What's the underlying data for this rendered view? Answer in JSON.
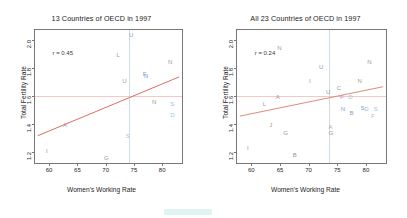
{
  "chart_data": [
    {
      "type": "scatter",
      "panel": "left",
      "title": "13 Countries of OECD in 1997",
      "xlabel": "Women's Working Rate",
      "ylabel": "Total Fertility Rate",
      "xlim": [
        57.5,
        83.5
      ],
      "ylim": [
        1.12,
        2.07
      ],
      "xticks": [
        60,
        65,
        70,
        75,
        80
      ],
      "yticks": [
        1.2,
        1.4,
        1.6,
        1.8,
        2.0
      ],
      "annotation": "r = 0.45",
      "grid": false,
      "reference_lines": {
        "horizontal_y": 1.6,
        "vertical_x": 74.2
      },
      "regression": {
        "x1": 58.0,
        "y1": 1.315,
        "x2": 83.0,
        "y2": 1.735,
        "color": "#e06c62"
      },
      "points": [
        {
          "label": "I",
          "x": 59.6,
          "y": 1.205,
          "color": "#9a9a9a"
        },
        {
          "label": "A",
          "x": 62.8,
          "y": 1.395,
          "color": "#9a9a9a"
        },
        {
          "label": "G",
          "x": 70.1,
          "y": 1.155,
          "color": "#9a9a9a"
        },
        {
          "label": "L",
          "x": 72.2,
          "y": 1.895,
          "color": "#9a9a9a"
        },
        {
          "label": "U",
          "x": 73.3,
          "y": 1.705,
          "color": "#9a9a9a"
        },
        {
          "label": "S",
          "x": 73.9,
          "y": 1.315,
          "color": "#9fc3dd"
        },
        {
          "label": "U",
          "x": 74.5,
          "y": 2.035,
          "color": "#9a9a9a"
        },
        {
          "label": "F",
          "x": 76.9,
          "y": 1.755,
          "color": "#6f9fd8"
        },
        {
          "label": "N",
          "x": 77.1,
          "y": 1.745,
          "color": "#6f9fd8"
        },
        {
          "label": "N",
          "x": 78.6,
          "y": 1.555,
          "color": "#9a9a9a"
        },
        {
          "label": "N",
          "x": 81.4,
          "y": 1.845,
          "color": "#9a9a9a"
        },
        {
          "label": "S",
          "x": 81.8,
          "y": 1.545,
          "color": "#9fc3dd"
        },
        {
          "label": "D",
          "x": 81.8,
          "y": 1.465,
          "color": "#9fc3dd"
        }
      ]
    },
    {
      "type": "scatter",
      "panel": "right",
      "title": "All 23 Countries of OECD in 1997",
      "xlabel": "Women's Working Rate",
      "ylabel": "Total Fertility Rate",
      "xlim": [
        57.5,
        83.5
      ],
      "ylim": [
        1.12,
        2.07
      ],
      "xticks": [
        60,
        65,
        70,
        75,
        80
      ],
      "yticks": [
        1.2,
        1.4,
        1.6,
        1.8,
        2.0
      ],
      "annotation": "r = 0.24",
      "grid": false,
      "reference_lines": {
        "horizontal_y": 1.6,
        "vertical_x": 73.6
      },
      "regression": {
        "x1": 58.0,
        "y1": 1.455,
        "x2": 83.0,
        "y2": 1.665,
        "color": "#e08a78"
      },
      "points": [
        {
          "label": "I",
          "x": 59.4,
          "y": 1.225,
          "color": "#9a9a9a"
        },
        {
          "label": "L",
          "x": 62.3,
          "y": 1.545,
          "color": "#9a9a9a"
        },
        {
          "label": "J",
          "x": 63.4,
          "y": 1.395,
          "color": "#9a9a9a"
        },
        {
          "label": "A",
          "x": 64.6,
          "y": 1.595,
          "color": "#9a9a9a"
        },
        {
          "label": "N",
          "x": 64.9,
          "y": 1.945,
          "color": "#9a9a9a"
        },
        {
          "label": "G",
          "x": 66.0,
          "y": 1.335,
          "color": "#9a9a9a"
        },
        {
          "label": "B",
          "x": 67.6,
          "y": 1.175,
          "color": "#9a9a9a"
        },
        {
          "label": "I",
          "x": 70.2,
          "y": 1.705,
          "color": "#9a9a9a"
        },
        {
          "label": "U",
          "x": 72.2,
          "y": 1.805,
          "color": "#9a9a9a"
        },
        {
          "label": "U",
          "x": 73.4,
          "y": 1.625,
          "color": "#9a9a9a"
        },
        {
          "label": "A",
          "x": 73.8,
          "y": 1.375,
          "color": "#c8a0a8"
        },
        {
          "label": "G",
          "x": 73.9,
          "y": 1.335,
          "color": "#9a9a9a"
        },
        {
          "label": "C",
          "x": 75.3,
          "y": 1.655,
          "color": "#9a9a9a"
        },
        {
          "label": "F",
          "x": 75.8,
          "y": 1.595,
          "color": "#b4a0c8"
        },
        {
          "label": "N",
          "x": 76.0,
          "y": 1.505,
          "color": "#7da3d0"
        },
        {
          "label": "D",
          "x": 77.3,
          "y": 1.595,
          "color": "#9fc3dd"
        },
        {
          "label": "B",
          "x": 77.5,
          "y": 1.475,
          "color": "#7da3d0"
        },
        {
          "label": "N",
          "x": 78.9,
          "y": 1.705,
          "color": "#9a9a9a"
        },
        {
          "label": "S",
          "x": 79.4,
          "y": 1.515,
          "color": "#7da3d0"
        },
        {
          "label": "D",
          "x": 80.1,
          "y": 1.505,
          "color": "#9fc3dd"
        },
        {
          "label": "N",
          "x": 80.6,
          "y": 1.845,
          "color": "#9a9a9a"
        },
        {
          "label": "F",
          "x": 81.2,
          "y": 1.455,
          "color": "#9fc3dd"
        },
        {
          "label": "S",
          "x": 81.7,
          "y": 1.505,
          "color": "#9fc3dd"
        }
      ]
    }
  ]
}
